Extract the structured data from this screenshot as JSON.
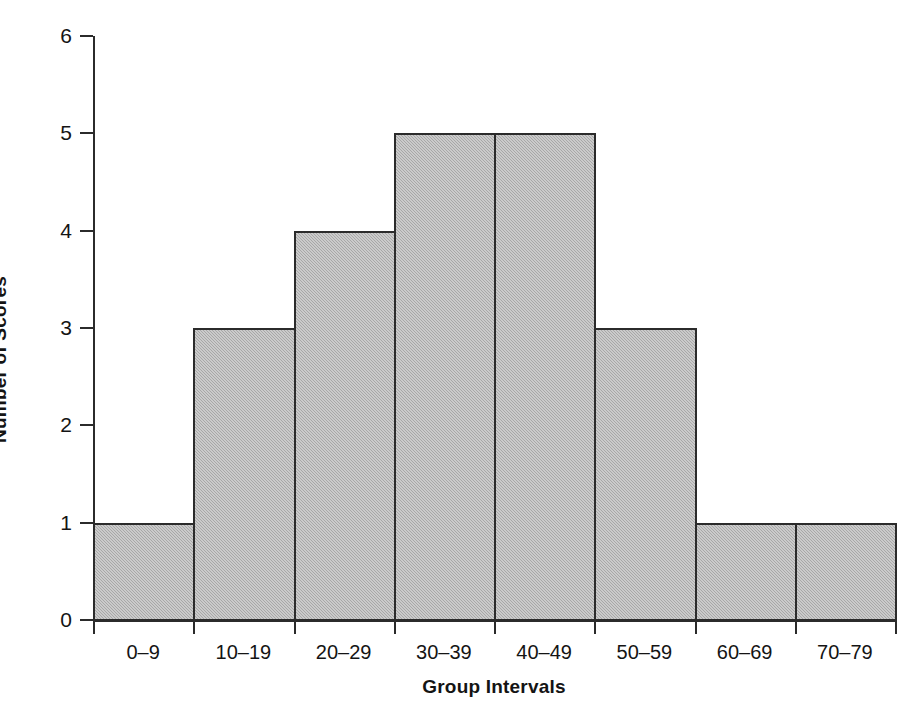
{
  "chart_data": {
    "type": "bar",
    "title": "",
    "subtitle": "",
    "xlabel": "Group Intervals",
    "ylabel": "Number of Scores",
    "categories": [
      "0–9",
      "10–19",
      "20–29",
      "30–39",
      "40–49",
      "50–59",
      "60–69",
      "70–79"
    ],
    "values": [
      1,
      3,
      4,
      5,
      5,
      3,
      1,
      1
    ],
    "ylim": [
      0,
      6
    ],
    "yticks": [
      0,
      1,
      2,
      3,
      4,
      5,
      6
    ],
    "ytick_labels": [
      "0",
      "1",
      "2",
      "3",
      "4",
      "5",
      "6"
    ],
    "grid": false,
    "legend": null,
    "legend_position": "none",
    "bar_fill_color": "#b6b6b6",
    "bar_edge_color": "#2b2b2b",
    "background_color": "#ffffff",
    "annotations": []
  },
  "axes": {
    "x_title": "Group Intervals",
    "y_title": "Number of Scores"
  }
}
